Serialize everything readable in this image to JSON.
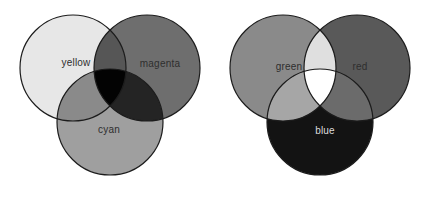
{
  "colors": {
    "background": "#ffffff",
    "outline": "#1c1c1c",
    "label_dark": "#2e2e2e",
    "label_light": "#dcdcdc"
  },
  "left_venn": {
    "yellow": {
      "label": "yellow",
      "fill": "#e7e7e7"
    },
    "magenta": {
      "label": "magenta",
      "fill": "#6e6e6e"
    },
    "cyan": {
      "label": "cyan",
      "fill": "#9f9f9f"
    },
    "overlap_yellow_magenta": {
      "fill": "#565656"
    },
    "overlap_yellow_cyan": {
      "fill": "#8a8a8a"
    },
    "overlap_magenta_cyan": {
      "fill": "#242424"
    },
    "center": {
      "fill": "#030303"
    }
  },
  "right_venn": {
    "green": {
      "label": "green",
      "fill": "#8a8a8a"
    },
    "red": {
      "label": "red",
      "fill": "#595959"
    },
    "blue": {
      "label": "blue",
      "fill": "#131313"
    },
    "overlap_green_red": {
      "fill": "#dfdfdf"
    },
    "overlap_green_blue": {
      "fill": "#a6a6a6"
    },
    "overlap_red_blue": {
      "fill": "#6b6b6b"
    },
    "center": {
      "fill": "#ffffff"
    }
  }
}
